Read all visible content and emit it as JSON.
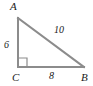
{
  "figure": {
    "type": "right-triangle",
    "stroke_color": "#8c8c8c",
    "text_color": "#1a1a1a",
    "background": "#ffffff",
    "vertices": {
      "A": {
        "label": "A",
        "x": 18,
        "y": 18
      },
      "B": {
        "label": "B",
        "x": 84,
        "y": 67
      },
      "C": {
        "label": "C",
        "x": 18,
        "y": 67
      }
    },
    "sides": {
      "leg_vertical": {
        "label": "6",
        "from": "A",
        "to": "C"
      },
      "leg_horizontal": {
        "label": "8",
        "from": "C",
        "to": "B"
      },
      "hypotenuse": {
        "label": "10",
        "from": "A",
        "to": "B"
      }
    },
    "right_angle": {
      "at": "C",
      "marker": "square",
      "size": 9
    }
  }
}
